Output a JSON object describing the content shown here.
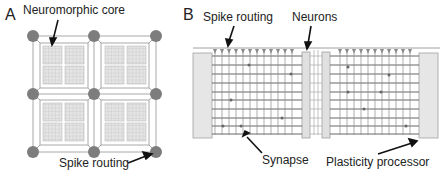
{
  "panel_a": {
    "letter": "A",
    "label_core": "Neuromorphic core",
    "label_routing": "Spike routing"
  },
  "panel_b": {
    "letter": "B",
    "label_routing": "Spike routing",
    "label_neurons": "Neurons",
    "label_synapse": "Synapse",
    "label_plasticity": "Plasticity processor"
  },
  "colors": {
    "node": "#7a7a7a",
    "line": "#9a9a9a",
    "grid": "#555555",
    "block_fill": "#e6e6e6",
    "block_stroke": "#9e9e9e",
    "text": "#222222"
  }
}
